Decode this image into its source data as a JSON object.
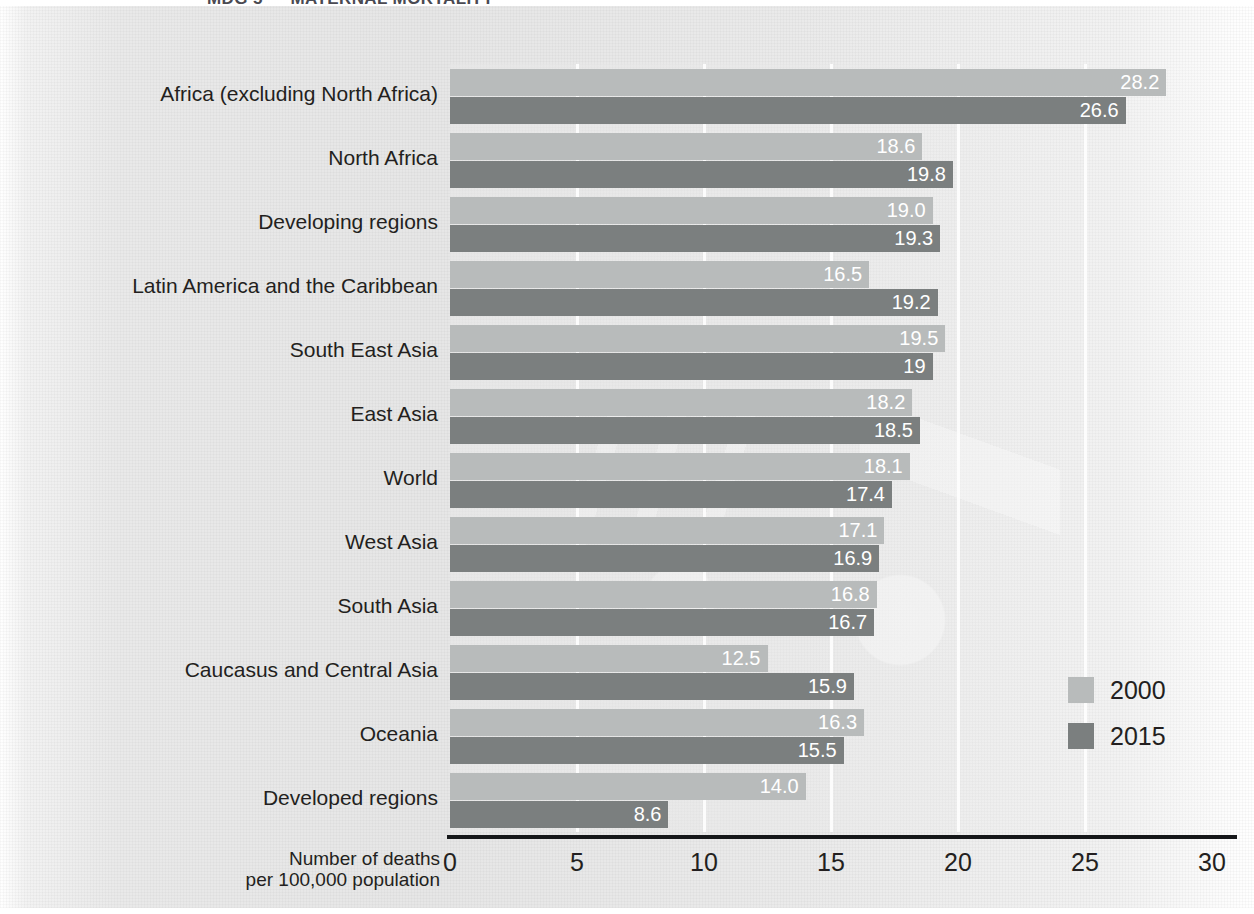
{
  "title_strip": {
    "text": "MDG 5 — MATERNAL MORTALITY"
  },
  "legend": {
    "position": "bottom-right",
    "items": [
      {
        "label": "2000",
        "color": "#b8bbbb"
      },
      {
        "label": "2015",
        "color": "#7b7f7f"
      }
    ]
  },
  "axis": {
    "title_line1": "Number of deaths",
    "title_line2": "per 100,000 population",
    "ticks": [
      "0",
      "5",
      "10",
      "15",
      "20",
      "25",
      "30"
    ]
  },
  "chart_data": {
    "type": "bar",
    "orientation": "horizontal",
    "title": "MDG 5 — MATERNAL MORTALITY",
    "xlabel": "Number of deaths per 100,000 population",
    "ylabel": "",
    "xlim": [
      0,
      30
    ],
    "xticks": [
      0,
      5,
      10,
      15,
      20,
      25,
      30
    ],
    "grid": true,
    "legend_position": "bottom-right",
    "categories": [
      "Africa (excluding North Africa)",
      "North Africa",
      "Developing regions",
      "Latin America and the Caribbean",
      "South East Asia",
      "East Asia",
      "World",
      "West Asia",
      "South Asia",
      "Caucasus and Central Asia",
      "Oceania",
      "Developed regions"
    ],
    "series": [
      {
        "name": "2000",
        "color": "#b8bbbb",
        "values": [
          28.2,
          18.6,
          19.0,
          16.5,
          19.5,
          18.2,
          18.1,
          17.1,
          16.8,
          12.5,
          16.3,
          14.0
        ],
        "labels": [
          "28.2",
          "18.6",
          "19.0",
          "16.5",
          "19.5",
          "18.2",
          "18.1",
          "17.1",
          "16.8",
          "12.5",
          "16.3",
          "14.0"
        ]
      },
      {
        "name": "2015",
        "color": "#7b7f7f",
        "values": [
          26.6,
          19.8,
          19.3,
          19.2,
          19.0,
          18.5,
          17.4,
          16.9,
          16.7,
          15.9,
          15.5,
          8.6
        ],
        "labels": [
          "26.6",
          "19.8",
          "19.3",
          "19.2",
          "19",
          "18.5",
          "17.4",
          "16.9",
          "16.7",
          "15.9",
          "15.5",
          "8.6"
        ]
      }
    ]
  }
}
